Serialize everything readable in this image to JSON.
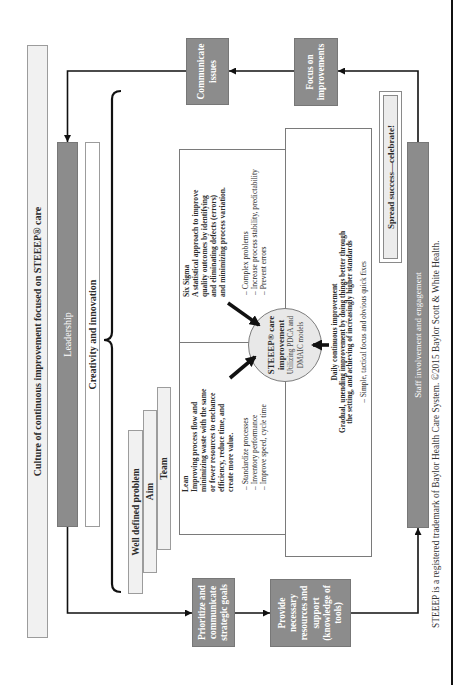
{
  "title_bar": "Culture of continuous improvement focused on STEEEP® care",
  "leadership_bar": "Leadership",
  "creativity_bar": "Creativity and innovation",
  "foundation_stack": [
    "Well defined problem",
    "Aim",
    "Team"
  ],
  "cycle": {
    "prioritize": [
      "Prioritize and",
      "communicate",
      "strategic goals"
    ],
    "provide": [
      "Provide",
      "necessary",
      "resources and",
      "support",
      "(knowledge of",
      "tools)"
    ],
    "staff": "Staff involvement and engagement",
    "focus": [
      "Focus on",
      "improvements"
    ],
    "communicate": [
      "Communicate",
      "issues"
    ]
  },
  "methods": {
    "lean": {
      "title": "Lean",
      "description": [
        "Improving process flow and",
        "minimizing waste with the same",
        "or fewer resources to enchance",
        "efficiency, reduce time, and",
        "create more value."
      ],
      "bullets": [
        "– Standardize processes",
        "– Inventory performance",
        "– Improve speed, cycle time"
      ]
    },
    "six_sigma": {
      "title": "Six Sigma",
      "description": [
        "A statistical approach to improve",
        "quality outcomes by identifying",
        "and eliminating defects (errors)",
        "and minimizing process variation."
      ],
      "bullets": [
        "– Complex problems",
        "– Increase process stability, predictability",
        "– Prevent errors"
      ]
    },
    "daily": {
      "title": "Daily continuous improvement",
      "description": [
        "Gradual, unending improvement by doing things better through",
        "the setting, and achieving of increasingly higher standards"
      ],
      "bullets": [
        "– Simple, tactical focus and obvious quick fixes"
      ]
    }
  },
  "center": {
    "title": [
      "STEEEP® care",
      "improvement"
    ],
    "subtitle": [
      "Utilizing PDCA and",
      "DMAIC models"
    ]
  },
  "spread": "Spread success—celebrate!",
  "footer": "STEEEP is a registered trademark of Baylor Health Care System. ©2015 Baylor Scott & White Health.",
  "colors": {
    "dark_box": "#8c8c8c",
    "light_box": "#f1f1f1",
    "border": "#9c9c9c",
    "connector": "#111111"
  }
}
